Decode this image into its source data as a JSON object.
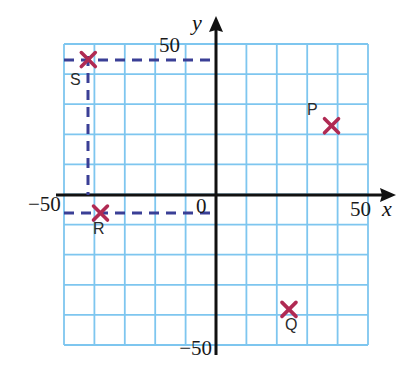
{
  "chart_data": {
    "type": "scatter",
    "title": "",
    "xlabel": "x",
    "ylabel": "y",
    "xlim": [
      -50,
      50
    ],
    "ylim": [
      -50,
      50
    ],
    "grid": true,
    "grid_step": 10,
    "legend": "none",
    "origin_label": "0",
    "x_tick_labels": [
      "-50",
      "50"
    ],
    "y_tick_labels": [
      "50",
      "-50"
    ],
    "points": [
      {
        "name": "P",
        "x": 38,
        "y": 23,
        "label_dx": -14,
        "label_dy": -8
      },
      {
        "name": "Q",
        "x": 24,
        "y": -38,
        "label_dx": -2,
        "label_dy": 20
      },
      {
        "name": "R",
        "x": -38,
        "y": -6,
        "label_dx": -4,
        "label_dy": 22
      },
      {
        "name": "S",
        "x": -42,
        "y": 45,
        "label_dx": -12,
        "label_dy": 22
      }
    ],
    "guide_lines": [
      {
        "from": "S",
        "to_axis": "y",
        "style": "dashed"
      },
      {
        "from": "S",
        "to_axis": "x",
        "style": "dashed"
      },
      {
        "from": "R",
        "to_axis": "y",
        "style": "dashed"
      },
      {
        "from": "R",
        "to_axis": "x-left",
        "style": "dashed"
      }
    ]
  },
  "axes": {
    "y_axis_top_label": "50",
    "y_axis_bottom_label": "−50",
    "x_axis_left_label": "−50",
    "x_axis_right_label": "50",
    "origin": "0",
    "x_var": "x",
    "y_var": "y"
  },
  "points": {
    "p_label": "P",
    "q_label": "Q",
    "r_label": "R",
    "s_label": "S"
  },
  "colors": {
    "grid": "#7ec6ef",
    "axis": "#111111",
    "marker": "#b02a53",
    "dashed": "#3a3f96",
    "background": "#ffffff"
  }
}
